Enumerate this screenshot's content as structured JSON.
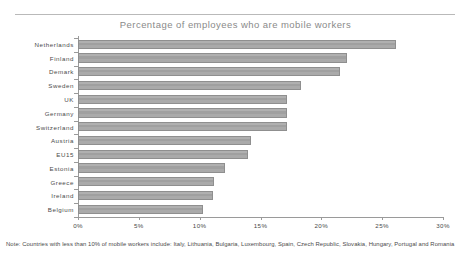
{
  "chart_data": {
    "type": "bar",
    "orientation": "horizontal",
    "title": "Percentage of employees who are mobile workers",
    "xlabel": "",
    "ylabel": "",
    "xlim": [
      0,
      30
    ],
    "grid": false,
    "legend": null,
    "xtick_labels": [
      "0%",
      "5%",
      "10%",
      "15%",
      "20%",
      "25%",
      "30%"
    ],
    "xtick_values": [
      0,
      5,
      10,
      15,
      20,
      25,
      30
    ],
    "categories": [
      "Netherlands",
      "Finland",
      "Demark",
      "Sweden",
      "UK",
      "Germany",
      "Switzerland",
      "Austria",
      "EU15",
      "Estonia",
      "Greece",
      "Ireland",
      "Belgium"
    ],
    "values": [
      26.1,
      22.1,
      21.5,
      18.3,
      17.2,
      17.2,
      17.2,
      14.2,
      14.0,
      12.1,
      11.2,
      11.1,
      10.3
    ],
    "bar_color": "#a3a3a3",
    "bar_border_color": "#8f8f8f",
    "axis_color": "#9a9a9a",
    "title_color": "#8a8a8a",
    "text_color": "#4a4a4a"
  },
  "footnote": "Note: Countries with less than 10% of mobile workers include: Italy, Lithuania, Bulgaria, Luxembourg, Spain, Czech Republic, Slovakia, Hungary, Portugal and Romania"
}
